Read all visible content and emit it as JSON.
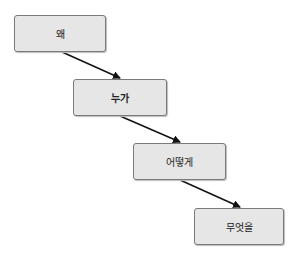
{
  "diagram": {
    "type": "flow-staircase",
    "nodes": [
      {
        "id": "n1",
        "label": "왜"
      },
      {
        "id": "n2",
        "label": "누가"
      },
      {
        "id": "n3",
        "label": "어떻게"
      },
      {
        "id": "n4",
        "label": "무엇을"
      }
    ],
    "edges": [
      {
        "from": "n1",
        "to": "n2"
      },
      {
        "from": "n2",
        "to": "n3"
      },
      {
        "from": "n3",
        "to": "n4"
      }
    ],
    "colors": {
      "box_fill": "#e6e6e6",
      "box_border": "#7a7a7a",
      "arrow": "#111111"
    }
  }
}
